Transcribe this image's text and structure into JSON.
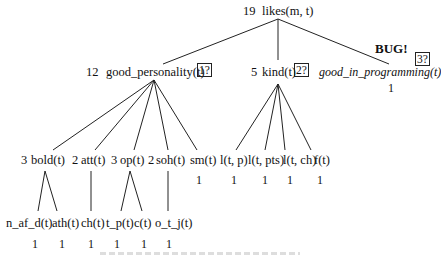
{
  "tree": {
    "root": {
      "count": "19",
      "label": "likes(m, t)"
    },
    "level1": [
      {
        "count": "12",
        "label": "good_personality(t)",
        "query": "1?"
      },
      {
        "count": "5",
        "label": "kind(t)",
        "query": "2?"
      },
      {
        "count": "",
        "label": "good_in_programming(t)",
        "query": "3?",
        "value": "1",
        "annotation": "BUG!"
      }
    ],
    "level2": [
      {
        "count": "3",
        "label": "bold(t)"
      },
      {
        "count": "2",
        "label": "att(t)"
      },
      {
        "count": "3",
        "label": "op(t)"
      },
      {
        "count": "2",
        "label": "soh(t)"
      },
      {
        "count": "",
        "label": "sm(t)",
        "value": "1"
      },
      {
        "count": "",
        "label": "l(t, p)",
        "value": "1"
      },
      {
        "count": "",
        "label": "l(t, pts)",
        "value": "1"
      },
      {
        "count": "",
        "label": "l(t, ch)",
        "value": "1"
      },
      {
        "count": "",
        "label": "f(t)",
        "value": "1"
      }
    ],
    "level3": [
      {
        "label": "n_af_d(t)",
        "value": "1"
      },
      {
        "label": "ath(t)",
        "value": "1"
      },
      {
        "label": "ch(t)",
        "value": "1"
      },
      {
        "label": "t_p(t)",
        "value": "1"
      },
      {
        "label": "c(t)",
        "value": "1"
      },
      {
        "label": "o_t_j(t)",
        "value": "1"
      }
    ]
  },
  "colors": {
    "ink": "#111111",
    "background": "#ffffff"
  }
}
